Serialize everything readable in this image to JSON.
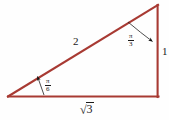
{
  "figure": {
    "type": "right-triangle-diagram",
    "background_color": "#fefefe",
    "stroke_color": "#a83a33",
    "text_color": "#1a1a1a",
    "width": 169,
    "height": 120,
    "triangle": {
      "vertices": {
        "left": [
          8,
          97
        ],
        "bottom_right": [
          158,
          97
        ],
        "top_right": [
          158,
          5
        ]
      },
      "right_angle_at": "bottom_right"
    },
    "sides": {
      "hypotenuse_label": "2",
      "vertical_leg_label": "1",
      "base_label_radical_sign": "√",
      "base_label_radicand": "3",
      "base_label_text": "√3"
    },
    "angles": {
      "left": {
        "numerator": "π",
        "denominator": "6",
        "text": "π/6",
        "pointer": "line-with-arrowhead"
      },
      "top_right": {
        "numerator": "π",
        "denominator": "3",
        "text": "π/3",
        "pointer": "curved-arc-with-arrowhead"
      }
    }
  }
}
